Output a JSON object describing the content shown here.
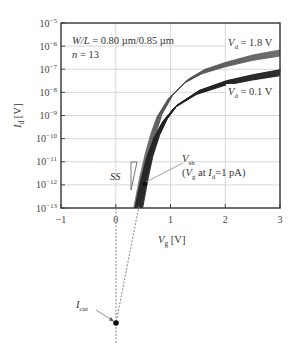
{
  "chart_data": {
    "type": "line",
    "title": "",
    "xlabel": "Vg [V]",
    "ylabel": "Id [V]",
    "xlim": [
      -1,
      3
    ],
    "ylim_log10": [
      -13,
      -5
    ],
    "yscale": "log",
    "x_ticks": [
      "-1",
      "0",
      "1",
      "2",
      "3"
    ],
    "y_ticks": [
      "10^-13",
      "10^-12",
      "10^-11",
      "10^-10",
      "10^-9",
      "10^-8",
      "10^-7",
      "10^-6",
      "10^-5"
    ],
    "grid": true,
    "series": [
      {
        "name": "Vd = 1.8 V",
        "n_devices": 13,
        "x": [
          0.4,
          0.5,
          0.6,
          0.7,
          0.8,
          1.0,
          1.3,
          1.6,
          2.0,
          2.5,
          3.0
        ],
        "log10_y": [
          -13.0,
          -11.7,
          -10.6,
          -9.7,
          -9.0,
          -8.2,
          -7.5,
          -7.1,
          -6.8,
          -6.5,
          -6.3
        ]
      },
      {
        "name": "Vd = 0.1 V",
        "n_devices": 13,
        "x": [
          0.42,
          0.52,
          0.62,
          0.75,
          0.9,
          1.1,
          1.5,
          2.0,
          2.5,
          3.0
        ],
        "log10_y": [
          -13.0,
          -11.8,
          -10.8,
          -9.9,
          -9.2,
          -8.6,
          -8.0,
          -7.6,
          -7.35,
          -7.15
        ]
      }
    ],
    "annotations": [
      {
        "text": "W/L = 0.80 µm/0.85 µm"
      },
      {
        "text": "n = 13"
      },
      {
        "text": "Vd = 1.8 V"
      },
      {
        "text": "Vd = 0.1 V"
      },
      {
        "text": "SS"
      },
      {
        "text": "Vsh"
      },
      {
        "text": "(Vg at Id=1 pA)"
      },
      {
        "text": "Icut"
      }
    ]
  },
  "labels": {
    "wl_prefix": "W/L",
    "wl_value": " = 0.80 µm/0.85 µm",
    "n_prefix": "n",
    "n_value": " = 13",
    "vd_high_var": "V",
    "vd_high_sub": "d",
    "vd_high_val": " = 1.8 V",
    "vd_low_var": "V",
    "vd_low_sub": "d",
    "vd_low_val": " = 0.1 V",
    "ss": "SS",
    "vsh_var": "V",
    "vsh_sub": "sh",
    "vsh_desc_open": "(",
    "vsh_desc_var": "V",
    "vsh_desc_sub": "g",
    "vsh_desc_mid": " at ",
    "vsh_desc_var2": "I",
    "vsh_desc_sub2": "d",
    "vsh_desc_end": "=1 pA)",
    "icut_var": "I",
    "icut_sub": "cut",
    "xlabel_var": "V",
    "xlabel_sub": "g",
    "xlabel_unit": " [V]",
    "ylabel_var": "I",
    "ylabel_sub": "d",
    "ylabel_unit": " [V]",
    "xticks": [
      "−1",
      "0",
      "1",
      "2",
      "3"
    ],
    "ytick_base": "10",
    "ytick_exps": [
      "−13",
      "−12",
      "−11",
      "−10",
      "−9",
      "−8",
      "−7",
      "−6",
      "−5"
    ]
  }
}
